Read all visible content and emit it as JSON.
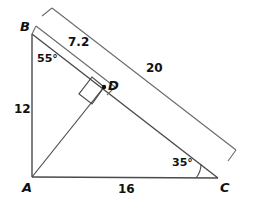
{
  "figure": {
    "type": "geometry-diagram",
    "shape": "right-triangle-with-altitude",
    "background_color": "#ffffff",
    "stroke_color": "#4a4a4a",
    "text_color": "#111111"
  },
  "vertices": {
    "a": {
      "label": "A",
      "x": 32,
      "y": 177,
      "label_x": 22,
      "label_y": 181
    },
    "b": {
      "label": "B",
      "x": 32,
      "y": 34,
      "label_x": 20,
      "label_y": 20
    },
    "c": {
      "label": "C",
      "x": 218,
      "y": 178,
      "label_x": 220,
      "label_y": 181
    },
    "d": {
      "label": "D",
      "x": 104,
      "y": 87,
      "label_x": 108,
      "label_y": 79
    }
  },
  "measures": {
    "ab": {
      "value": "12",
      "x": 14,
      "y": 103
    },
    "ac": {
      "value": "16",
      "x": 118,
      "y": 183
    },
    "bc": {
      "value": "20",
      "x": 146,
      "y": 62
    },
    "bd": {
      "value": "7.2",
      "x": 68,
      "y": 36
    }
  },
  "angles": {
    "at_b": {
      "value": "55°",
      "x": 37,
      "y": 53
    },
    "at_c": {
      "value": "35°",
      "x": 172,
      "y": 157
    }
  },
  "annotations": {
    "right_angle_at_d": "square-marker",
    "arc_at_c": "angle-arc",
    "bracket_bc": "dimension-bracket",
    "band_bd": "dimension-band"
  }
}
